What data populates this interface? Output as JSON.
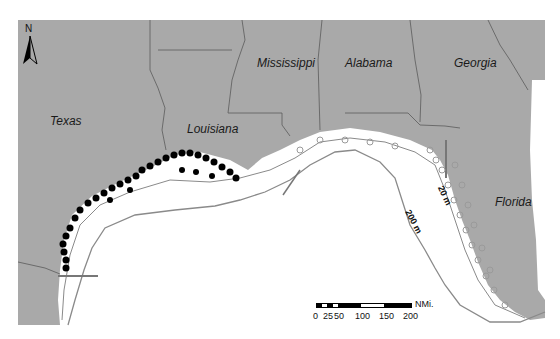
{
  "map": {
    "region": "Gulf of Mexico",
    "states": [
      {
        "name": "Texas",
        "x": 50,
        "y": 114
      },
      {
        "name": "Louisiana",
        "x": 187,
        "y": 123
      },
      {
        "name": "Mississippi",
        "x": 257,
        "y": 57
      },
      {
        "name": "Alabama",
        "x": 345,
        "y": 57
      },
      {
        "name": "Georgia",
        "x": 454,
        "y": 57
      },
      {
        "name": "Florida",
        "x": 495,
        "y": 196
      }
    ],
    "depth_contours": [
      {
        "label": "20 m",
        "x": 446,
        "y": 186,
        "rotate": 65
      },
      {
        "label": "200 m",
        "x": 405,
        "y": 219,
        "rotate": 62
      }
    ],
    "north_arrow": {
      "label": "N"
    },
    "scale_bar": {
      "unit": "NMi.",
      "ticks": [
        "0",
        "25",
        "50",
        "100",
        "150",
        "200"
      ]
    },
    "colors": {
      "land": "#a9a9a9",
      "water": "#ffffff",
      "border": "#5a5a5a",
      "contour": "#8a8a8a",
      "filled_points": "#000000",
      "open_points": "#9a9a9a"
    }
  }
}
